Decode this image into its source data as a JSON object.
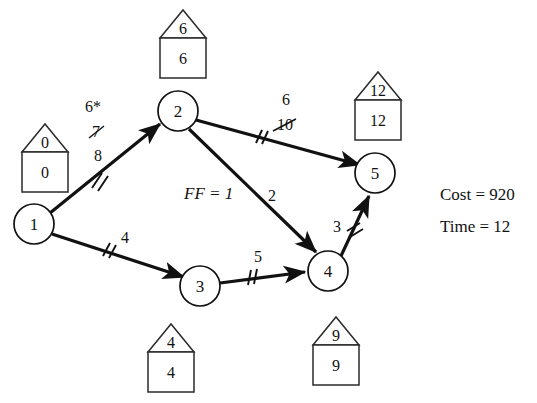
{
  "diagram": {
    "type": "activity-on-arrow-network",
    "nodes": [
      {
        "id": "1",
        "label": "1",
        "cx": 34,
        "cy": 224,
        "r": 20,
        "house": {
          "top": "0",
          "bottom": "0"
        }
      },
      {
        "id": "2",
        "label": "2",
        "cx": 178,
        "cy": 111,
        "r": 20,
        "house": {
          "top": "6",
          "bottom": "6"
        }
      },
      {
        "id": "3",
        "label": "3",
        "cx": 200,
        "cy": 286,
        "r": 20,
        "house": {
          "top": "4",
          "bottom": "4"
        }
      },
      {
        "id": "4",
        "label": "4",
        "cx": 328,
        "cy": 271,
        "r": 20,
        "house": {
          "top": "9",
          "bottom": "9"
        }
      },
      {
        "id": "5",
        "label": "5",
        "cx": 375,
        "cy": 173,
        "r": 20,
        "house": {
          "top": "12",
          "bottom": "12"
        }
      }
    ],
    "edges": [
      {
        "id": "e12",
        "from": "1",
        "to": "2",
        "labels": [
          "6*",
          "7",
          "8"
        ],
        "struck": [
          "7"
        ],
        "ticks": 2
      },
      {
        "id": "e13",
        "from": "1",
        "to": "3",
        "labels": [
          "4"
        ],
        "struck": [],
        "ticks": 2
      },
      {
        "id": "e25",
        "from": "2",
        "to": "5",
        "labels": [
          "6",
          "10"
        ],
        "struck": [
          "10"
        ],
        "ticks": 2
      },
      {
        "id": "e24",
        "from": "2",
        "to": "4",
        "labels": [
          "2"
        ],
        "struck": [],
        "ticks": 0
      },
      {
        "id": "e34",
        "from": "3",
        "to": "4",
        "labels": [
          "5"
        ],
        "struck": [],
        "ticks": 2
      },
      {
        "id": "e45",
        "from": "4",
        "to": "5",
        "labels": [
          "3"
        ],
        "struck": [],
        "ticks": 2
      }
    ],
    "annotations": {
      "free_float": "FF = 1"
    },
    "summary": {
      "cost_line": "Cost = 920",
      "time_line": "Time = 12"
    },
    "edge_label_text": {
      "e12_a": "6*",
      "e12_b": "7",
      "e12_c": "8",
      "e13_a": "4",
      "e25_a": "6",
      "e25_b": "10",
      "e24_a": "2",
      "e34_a": "5",
      "e45_a": "3"
    },
    "node_text": {
      "n1": "1",
      "n2": "2",
      "n3": "3",
      "n4": "4",
      "n5": "5"
    },
    "house_text": {
      "h1_top": "0",
      "h1_bottom": "0",
      "h2_top": "6",
      "h2_bottom": "6",
      "h3_top": "4",
      "h3_bottom": "4",
      "h4_top": "9",
      "h4_bottom": "9",
      "h5_top": "12",
      "h5_bottom": "12"
    },
    "colors": {
      "ink": "#111111",
      "paper": "#ffffff",
      "house_stroke": "#2a2a2a"
    }
  }
}
